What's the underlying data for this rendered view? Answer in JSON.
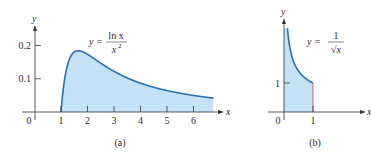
{
  "chart_data": [
    {
      "type": "area",
      "panel_label": "(a)",
      "function_label": {
        "lhs": "y =",
        "numerator": "ln x",
        "denominator": "x",
        "denominator_exp": "2"
      },
      "xlabel": "x",
      "ylabel": "y",
      "x_ticks": [
        "0",
        "1",
        "2",
        "3",
        "4",
        "5",
        "6"
      ],
      "y_ticks": [
        "0.1",
        "0.2"
      ],
      "xlim": [
        0,
        6.75
      ],
      "ylim": [
        0,
        0.25
      ],
      "shaded_from": 1,
      "x": [
        1,
        1.25,
        1.5,
        1.65,
        2,
        2.5,
        3,
        3.5,
        4,
        4.5,
        5,
        5.5,
        6,
        6.5,
        6.75
      ],
      "values": [
        0,
        0.143,
        0.18,
        0.184,
        0.173,
        0.147,
        0.122,
        0.102,
        0.087,
        0.074,
        0.064,
        0.056,
        0.05,
        0.044,
        0.042
      ]
    },
    {
      "type": "area",
      "panel_label": "(b)",
      "function_label": {
        "lhs": "y =",
        "numerator": "1",
        "denominator": "√x"
      },
      "xlabel": "x",
      "ylabel": "y",
      "x_ticks": [
        "0",
        "1"
      ],
      "y_ticks": [
        "1"
      ],
      "xlim": [
        0,
        1
      ],
      "shaded_from": 0,
      "shaded_to": 1,
      "x": [
        0.12,
        0.2,
        0.3,
        0.4,
        0.5,
        0.6,
        0.7,
        0.8,
        0.9,
        1.0
      ],
      "values": [
        2.89,
        2.24,
        1.83,
        1.58,
        1.41,
        1.29,
        1.2,
        1.12,
        1.05,
        1.0
      ]
    }
  ],
  "colors": {
    "curve": "#2a6fb5",
    "fill": "#c5e1f5",
    "axis": "#333333"
  }
}
